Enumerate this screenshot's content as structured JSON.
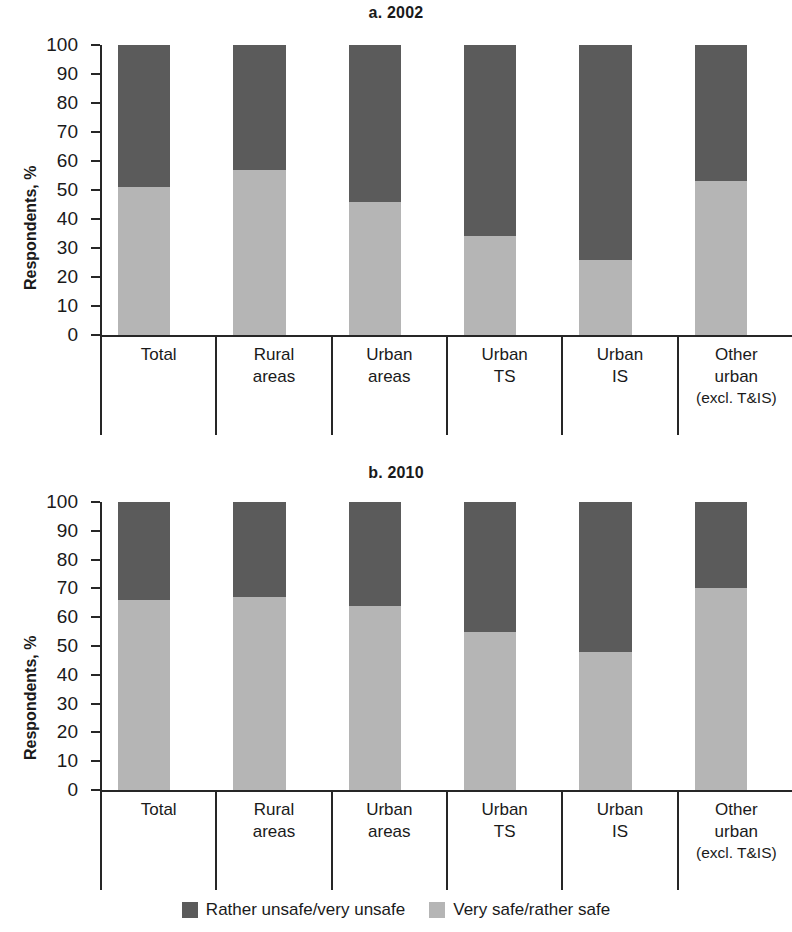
{
  "figure": {
    "ylabel": "Respondents, %",
    "legend": [
      {
        "label": "Rather unsafe/very unsafe",
        "color": "#5b5b5b",
        "swatch_name": "legend-swatch-unsafe"
      },
      {
        "label": "Very safe/rather safe",
        "color": "#b5b5b5",
        "swatch_name": "legend-swatch-safe"
      }
    ]
  },
  "chart_data": [
    {
      "type": "bar",
      "title": "a. 2002",
      "stacked": true,
      "xlabel": "",
      "ylabel": "Respondents, %",
      "ylim": [
        0,
        100
      ],
      "yticks": [
        0,
        10,
        20,
        30,
        40,
        50,
        60,
        70,
        80,
        90,
        100
      ],
      "ytick_labels": [
        "0",
        "10",
        "20",
        "30",
        "40",
        "50",
        "60",
        "70",
        "80",
        "90",
        "100"
      ],
      "grid": false,
      "legend_position": "bottom",
      "categories": [
        "Total",
        "Rural areas",
        "Urban areas",
        "Urban TS",
        "Urban IS",
        "Other urban (excl. T&IS)"
      ],
      "category_lines": [
        [
          "Total"
        ],
        [
          "Rural",
          "areas"
        ],
        [
          "Urban",
          "areas"
        ],
        [
          "Urban",
          "TS"
        ],
        [
          "Urban",
          "IS"
        ],
        [
          "Other",
          "urban",
          "(excl. T&IS)"
        ]
      ],
      "series": [
        {
          "name": "Very safe/rather safe",
          "color": "#b5b5b5",
          "values": [
            51,
            57,
            46,
            34,
            26,
            53
          ]
        },
        {
          "name": "Rather unsafe/very unsafe",
          "color": "#5b5b5b",
          "values": [
            49,
            43,
            54,
            66,
            74,
            47
          ]
        }
      ]
    },
    {
      "type": "bar",
      "title": "b. 2010",
      "stacked": true,
      "xlabel": "",
      "ylabel": "Respondents, %",
      "ylim": [
        0,
        100
      ],
      "yticks": [
        0,
        10,
        20,
        30,
        40,
        50,
        60,
        70,
        80,
        90,
        100
      ],
      "ytick_labels": [
        "0",
        "10",
        "20",
        "30",
        "40",
        "50",
        "60",
        "70",
        "80",
        "90",
        "100"
      ],
      "grid": false,
      "legend_position": "bottom",
      "categories": [
        "Total",
        "Rural areas",
        "Urban areas",
        "Urban TS",
        "Urban IS",
        "Other urban (excl. T&IS)"
      ],
      "category_lines": [
        [
          "Total"
        ],
        [
          "Rural",
          "areas"
        ],
        [
          "Urban",
          "areas"
        ],
        [
          "Urban",
          "TS"
        ],
        [
          "Urban",
          "IS"
        ],
        [
          "Other",
          "urban",
          "(excl. T&IS)"
        ]
      ],
      "series": [
        {
          "name": "Very safe/rather safe",
          "color": "#b5b5b5",
          "values": [
            66,
            67,
            64,
            55,
            48,
            70
          ]
        },
        {
          "name": "Rather unsafe/very unsafe",
          "color": "#5b5b5b",
          "values": [
            34,
            33,
            36,
            45,
            52,
            30
          ]
        }
      ]
    }
  ]
}
